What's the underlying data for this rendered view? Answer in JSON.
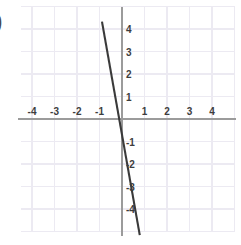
{
  "figure": {
    "label_fragment": ")",
    "background_color": "#ffffff",
    "grid_color": "#eceaf2",
    "axis_color": "#9b9b9b",
    "line_color": "#3a3a3a",
    "tick_text_color": "#3d3d3d"
  },
  "chart_data": {
    "type": "line",
    "title": "",
    "xlabel": "",
    "ylabel": "",
    "xlim": [
      -4.6,
      5.1
    ],
    "ylim": [
      -5.6,
      4.8
    ],
    "grid": true,
    "grid_step": 1,
    "legend": "none",
    "x_ticks": [
      -4,
      -3,
      -2,
      -1,
      1,
      2,
      3,
      4
    ],
    "y_ticks": [
      4,
      3,
      2,
      1,
      -1,
      -2,
      -3,
      -4
    ],
    "x_tick_labels": [
      "-4",
      "-3",
      "-2",
      "-1",
      "1",
      "2",
      "3",
      "4"
    ],
    "y_tick_labels": [
      "4",
      "3",
      "2",
      "1",
      "-1",
      "-2",
      "-3",
      "-4"
    ],
    "series": [
      {
        "name": "line",
        "equation": "y = -6x - 1",
        "slope": -6,
        "intercept": -1,
        "x": [
          -0.89,
          0.79
        ],
        "y": [
          4.33,
          -5.16
        ],
        "points": [
          {
            "x": -0.89,
            "y": 4.33
          },
          {
            "x": 0.0,
            "y": -1.0
          },
          {
            "x": 0.79,
            "y": -5.16
          }
        ]
      }
    ]
  },
  "x_axis_labels": [
    {
      "text": "-4",
      "value": -4
    },
    {
      "text": "-3",
      "value": -3
    },
    {
      "text": "-2",
      "value": -2
    },
    {
      "text": "-1",
      "value": -1
    },
    {
      "text": "1",
      "value": 1
    },
    {
      "text": "2",
      "value": 2
    },
    {
      "text": "3",
      "value": 3
    },
    {
      "text": "4",
      "value": 4
    }
  ],
  "y_axis_labels": [
    {
      "text": "4",
      "value": 4
    },
    {
      "text": "3",
      "value": 3
    },
    {
      "text": "2",
      "value": 2
    },
    {
      "text": "1",
      "value": 1
    },
    {
      "text": "-1",
      "value": -1
    },
    {
      "text": "-2",
      "value": -2
    },
    {
      "text": "-3",
      "value": -3
    },
    {
      "text": "-4",
      "value": -4
    }
  ]
}
